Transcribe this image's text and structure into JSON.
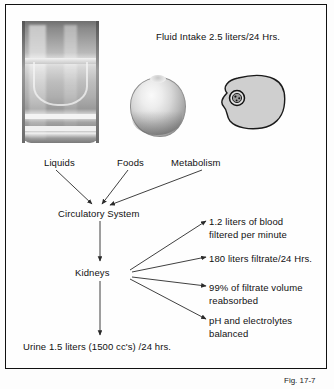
{
  "figure": {
    "caption": "Fig. 17-7",
    "title_note": "Fluid Intake 2.5 liters/24 Hrs."
  },
  "inputs": {
    "header": "Fluid Intake 2.5 liters/24 Hrs.",
    "items": [
      {
        "label": "Liquids",
        "icon": "glass-of-water-image"
      },
      {
        "label": "Foods",
        "icon": "apple-image"
      },
      {
        "label": "Metabolism",
        "icon": "cell-diagram-image"
      }
    ]
  },
  "flow": {
    "nodes": [
      {
        "id": "circulatory",
        "label": "Circulatory System"
      },
      {
        "id": "kidneys",
        "label": "Kidneys"
      },
      {
        "id": "urine",
        "label": "Urine 1.5 liters (1500 cc's) /24 hrs."
      }
    ]
  },
  "kidney_functions": [
    {
      "line1": "1.2 liters of blood",
      "line2": "filtered per minute"
    },
    {
      "line1": "180 liters filtrate/24 Hrs.",
      "line2": ""
    },
    {
      "line1": "99% of filtrate volume",
      "line2": "reabsorbed"
    },
    {
      "line1": "pH and electrolytes",
      "line2": "balanced"
    }
  ],
  "colors": {
    "frame": "#111111",
    "text": "#111111",
    "arrow": "#333333",
    "background": "#fefefe"
  }
}
